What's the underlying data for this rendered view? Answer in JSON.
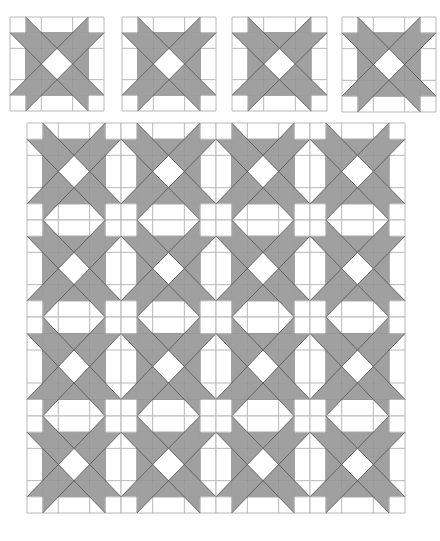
{
  "figure": {
    "top_cut_text": "",
    "colors": {
      "background": "#ffffff",
      "fill": "#a0a0a0",
      "grid_line": "#b8b8b8",
      "diagonal_line": "#5a5a5a",
      "outline": "#a8a8a8"
    },
    "block_units": 6,
    "grid_lines_units": [
      0,
      1,
      2,
      4,
      5,
      6
    ],
    "shape_units": {
      "center_square": [
        [
          1,
          1
        ],
        [
          5,
          1
        ],
        [
          5,
          5
        ],
        [
          1,
          5
        ]
      ],
      "center_diamond": [
        [
          3,
          2
        ],
        [
          4,
          3
        ],
        [
          3,
          4
        ],
        [
          2,
          3
        ]
      ],
      "arms": [
        [
          [
            1,
            0
          ],
          [
            2,
            1
          ],
          [
            1,
            1
          ]
        ],
        [
          [
            5,
            0
          ],
          [
            4,
            1
          ],
          [
            5,
            1
          ]
        ],
        [
          [
            0,
            1
          ],
          [
            1,
            1
          ],
          [
            1,
            2
          ]
        ],
        [
          [
            0,
            5
          ],
          [
            1,
            4
          ],
          [
            1,
            5
          ]
        ],
        [
          [
            1,
            5
          ],
          [
            2,
            5
          ],
          [
            1,
            6
          ]
        ],
        [
          [
            4,
            5
          ],
          [
            5,
            5
          ],
          [
            5,
            6
          ]
        ],
        [
          [
            6,
            1
          ],
          [
            5,
            1
          ],
          [
            5,
            2
          ]
        ],
        [
          [
            5,
            4
          ],
          [
            5,
            5
          ],
          [
            6,
            5
          ]
        ]
      ],
      "diagonals": [
        [
          [
            1,
            0
          ],
          [
            6,
            5
          ]
        ],
        [
          [
            0,
            1
          ],
          [
            5,
            6
          ]
        ],
        [
          [
            5,
            0
          ],
          [
            0,
            5
          ]
        ],
        [
          [
            6,
            1
          ],
          [
            1,
            6
          ]
        ]
      ]
    },
    "single_blocks": [
      {
        "name": "single-block-1",
        "x": 10,
        "y": 17,
        "w": 94,
        "h": 94
      },
      {
        "name": "single-block-2",
        "x": 122,
        "y": 17,
        "w": 94,
        "h": 94
      },
      {
        "name": "single-block-3",
        "x": 232,
        "y": 17,
        "w": 95,
        "h": 94
      },
      {
        "name": "single-block-4",
        "x": 342,
        "y": 17,
        "w": 94,
        "h": 95
      }
    ],
    "quilt": {
      "name": "quilt-layout",
      "x": 27,
      "y": 123,
      "cols": 4,
      "rows": 4,
      "col_edges": [
        27,
        121,
        216,
        310,
        405
      ],
      "row_edges": [
        123,
        220,
        317,
        416,
        513
      ]
    }
  }
}
